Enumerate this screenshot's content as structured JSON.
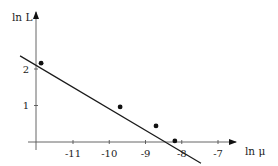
{
  "chart_data": {
    "type": "scatter",
    "title": "",
    "xlabel": "ln μ",
    "ylabel": "ln L",
    "x_ticks": [
      -11,
      -10,
      -9,
      -8,
      -7
    ],
    "x_tick_labels": [
      "-11",
      "-10",
      "-9",
      "-8",
      "-7"
    ],
    "y_ticks": [
      1,
      2
    ],
    "y_tick_labels": [
      "1",
      "2"
    ],
    "xlim": [
      -12.02,
      -6.5
    ],
    "ylim": [
      -0.6,
      3.6
    ],
    "grid": false,
    "legend": null,
    "series": [
      {
        "name": "data points",
        "type": "scatter",
        "x": [
          -11.88,
          -9.7,
          -8.71,
          -8.19
        ],
        "y": [
          2.16,
          0.96,
          0.44,
          0.03
        ]
      },
      {
        "name": "linear fit",
        "type": "line",
        "x": [
          -12.46,
          -7.47
        ],
        "y": [
          2.36,
          -0.58
        ]
      }
    ]
  },
  "labels": {
    "x_axis": "ln μ",
    "y_axis": "ln L"
  },
  "colors": {
    "axis": "#555555",
    "line": "#1a1a1a",
    "point": "#111111"
  }
}
